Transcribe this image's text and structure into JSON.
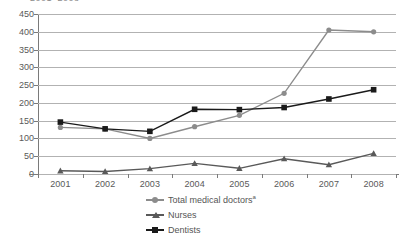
{
  "chart_data": {
    "type": "line",
    "title": "2001–2008",
    "xlabel": "",
    "ylabel": "",
    "categories": [
      "2001",
      "2002",
      "2003",
      "2004",
      "2005",
      "2006",
      "2007",
      "2008"
    ],
    "x": [
      2001,
      2002,
      2003,
      2004,
      2005,
      2006,
      2007,
      2008
    ],
    "ylim": [
      0,
      450
    ],
    "y_ticks": [
      0,
      50,
      100,
      150,
      200,
      250,
      300,
      350,
      400,
      450
    ],
    "grid": "horizontal",
    "legend_position": "bottom-center",
    "series": [
      {
        "name": "Total medical doctors",
        "name_footnote": "a",
        "color": "#8c8c8c",
        "marker": "circle",
        "values": [
          131,
          127,
          100,
          133,
          165,
          227,
          405,
          400
        ]
      },
      {
        "name": "Nurses",
        "color": "#595959",
        "marker": "triangle",
        "values": [
          9,
          7,
          15,
          30,
          16,
          43,
          26,
          58
        ]
      },
      {
        "name": "Dentists",
        "color": "#1a1a1a",
        "marker": "square",
        "values": [
          146,
          127,
          120,
          182,
          181,
          187,
          211,
          237
        ]
      }
    ]
  },
  "axis": {
    "y_tick_labels": [
      "0",
      "50",
      "100",
      "150",
      "200",
      "250",
      "300",
      "350",
      "400",
      "450"
    ],
    "x_tick_labels": [
      "2001",
      "2002",
      "2003",
      "2004",
      "2005",
      "2006",
      "2007",
      "2008"
    ]
  },
  "legend": {
    "items": [
      {
        "label": "Total medical doctors",
        "footnote": "a",
        "icon": "circle-marker-icon",
        "color": "#8c8c8c"
      },
      {
        "label": "Nurses",
        "footnote": "",
        "icon": "triangle-marker-icon",
        "color": "#595959"
      },
      {
        "label": "Dentists",
        "footnote": "",
        "icon": "square-marker-icon",
        "color": "#1a1a1a"
      }
    ]
  },
  "colors": {
    "gridline": "#b2b2b2",
    "axis": "#7a7a7a",
    "tick_text": "#595959",
    "title_text": "#8c8c8c",
    "background": "#ffffff"
  }
}
